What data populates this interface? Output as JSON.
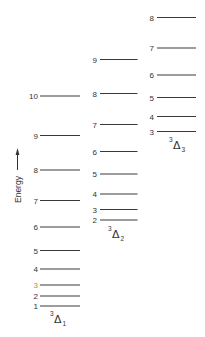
{
  "diagram": {
    "energy_axis_label": "Energy",
    "columns": [
      {
        "id": "delta1",
        "term": {
          "multiplicity": "3",
          "symbol": "Δ",
          "subscript": "1"
        },
        "levels": [
          "1",
          "2",
          "3",
          "4",
          "5",
          "6",
          "7",
          "8",
          "9",
          "10"
        ],
        "highlight_label": {
          "level": "3",
          "color": "#c08a2a"
        }
      },
      {
        "id": "delta2",
        "term": {
          "multiplicity": "3",
          "symbol": "Δ",
          "subscript": "2"
        },
        "levels": [
          "2",
          "3",
          "4",
          "5",
          "6",
          "7",
          "8",
          "9"
        ]
      },
      {
        "id": "delta3",
        "term": {
          "multiplicity": "3",
          "symbol": "Δ",
          "subscript": "3"
        },
        "levels": [
          "3",
          "4",
          "5",
          "6",
          "7",
          "8"
        ]
      }
    ]
  }
}
